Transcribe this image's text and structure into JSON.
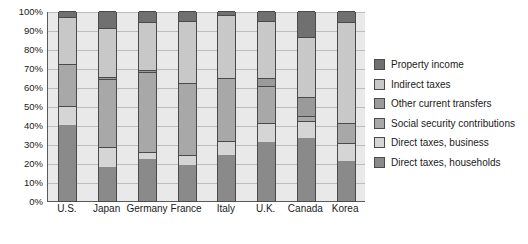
{
  "chart_data": {
    "type": "bar",
    "subtype": "stacked-100-percent",
    "title": "",
    "xlabel": "",
    "ylabel": "",
    "ylim": [
      0,
      100
    ],
    "ytick_labels": [
      "100%",
      "90%",
      "80%",
      "70%",
      "60%",
      "50%",
      "40%",
      "30%",
      "20%",
      "10%",
      "0%"
    ],
    "ytick_values": [
      100,
      90,
      80,
      70,
      60,
      50,
      40,
      30,
      20,
      10,
      0
    ],
    "grid": true,
    "legend_position": "right",
    "categories": [
      "U.S.",
      "Japan",
      "Germany",
      "France",
      "Italy",
      "U.K.",
      "Canada",
      "Korea"
    ],
    "series": [
      {
        "name": "Direct taxes, households",
        "color": "#8a8a8a",
        "values": [
          40.0,
          18.0,
          22.0,
          19.0,
          24.0,
          31.0,
          33.0,
          21.0
        ]
      },
      {
        "name": "Direct taxes, business",
        "color": "#d5d5d5",
        "values": [
          10.0,
          10.5,
          4.0,
          5.0,
          7.5,
          10.0,
          9.0,
          9.5
        ]
      },
      {
        "name": "Social security contributions",
        "color": "#a8a8a8",
        "values": [
          22.0,
          35.5,
          42.0,
          38.0,
          33.0,
          19.5,
          3.0,
          10.5
        ]
      },
      {
        "name": "Other current transfers",
        "color": "#9a9a9a",
        "values": [
          0.0,
          1.5,
          1.0,
          0.0,
          0.0,
          4.5,
          10.0,
          0.0
        ]
      },
      {
        "name": "Indirect taxes",
        "color": "#c8c8c8",
        "values": [
          25.0,
          25.5,
          25.0,
          33.0,
          33.5,
          29.5,
          31.5,
          53.0
        ]
      },
      {
        "name": "Property income",
        "color": "#707070",
        "values": [
          3.0,
          9.0,
          6.0,
          5.0,
          2.0,
          5.5,
          13.5,
          6.0
        ]
      }
    ]
  },
  "legend": {
    "items": [
      {
        "label": "Property income",
        "color": "#707070"
      },
      {
        "label": "Indirect taxes",
        "color": "#c8c8c8"
      },
      {
        "label": "Other current transfers",
        "color": "#9a9a9a"
      },
      {
        "label": "Social security contributions",
        "color": "#a8a8a8"
      },
      {
        "label": "Direct taxes, business",
        "color": "#d5d5d5"
      },
      {
        "label": "Direct taxes, households",
        "color": "#8a8a8a"
      }
    ]
  }
}
